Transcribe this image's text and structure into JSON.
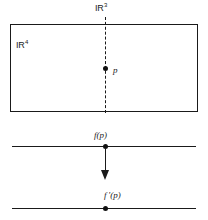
{
  "figure": {
    "caption_none": "",
    "labels": {
      "ambient_space": "IR",
      "ambient_space_exponent": "4",
      "slice_space": "IR",
      "slice_space_exponent": "3",
      "point": "p",
      "image_point": "f(p)",
      "derived_point": "f ′(p)"
    },
    "colors": {
      "ink": "#1a1a1a",
      "background": "#ffffff",
      "dot": "#111111"
    },
    "elements": {
      "rectangle_name": "R4 region rectangle",
      "dashed_line_name": "R3 slice dashed line",
      "arrow_name": "mapping arrow",
      "upper_line_name": "upper real line",
      "lower_line_name": "lower real line"
    }
  }
}
